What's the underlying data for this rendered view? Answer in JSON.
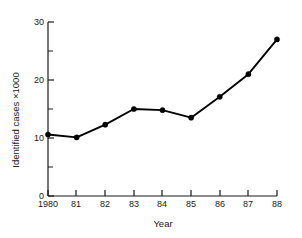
{
  "chart_data": {
    "type": "line",
    "title": "",
    "xlabel": "Year",
    "ylabel": "Identified cases ×1000",
    "categories": [
      "1980",
      "81",
      "82",
      "83",
      "84",
      "85",
      "86",
      "87",
      "88"
    ],
    "x": [
      1980,
      1981,
      1982,
      1983,
      1984,
      1985,
      1986,
      1987,
      1988
    ],
    "values": [
      10.6,
      10.1,
      12.3,
      15.0,
      14.8,
      13.5,
      17.1,
      21.0,
      27.0
    ],
    "series": [
      {
        "name": "Identified cases",
        "values": [
          10.6,
          10.1,
          12.3,
          15.0,
          14.8,
          13.5,
          17.1,
          21.0,
          27.0
        ]
      }
    ],
    "ylim": [
      0,
      30
    ],
    "y_major_ticks": [
      0,
      10,
      20,
      30
    ],
    "y_major_tick_labels": [
      "0",
      "10",
      "20",
      "30"
    ],
    "y_minor_ticks": [
      5,
      15,
      25
    ],
    "grid": false,
    "legend": false,
    "legend_position": "none",
    "marker": "filled-circle",
    "line_color": "#000000",
    "marker_color": "#000000",
    "axis_color": "#1a1a1a",
    "background_color": "#ffffff"
  },
  "axes": {
    "x_title": "Year",
    "y_title": "Identified cases ×1000",
    "x_tick_labels": [
      "1980",
      "81",
      "82",
      "83",
      "84",
      "85",
      "86",
      "87",
      "88"
    ],
    "y_tick_labels": [
      "0",
      "10",
      "20",
      "30"
    ]
  }
}
